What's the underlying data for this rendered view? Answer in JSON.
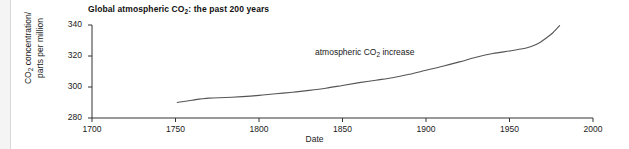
{
  "figure": {
    "background_color": "#ffffff",
    "axis_color": "#333333",
    "line_color": "#555555",
    "gutter_rule_color": "#d8d8d8"
  },
  "chart_data": {
    "type": "line",
    "title": "Global atmospheric CO2: the past 200 years",
    "title_parts": {
      "before": "Global atmospheric CO",
      "sub": "2",
      "after": ": the past 200 years"
    },
    "xlabel": "Date",
    "ylabel": "CO2 concentration/ parts per million",
    "ylabel_parts": {
      "line1_before": "CO",
      "line1_sub": "2",
      "line1_after": " concentration/",
      "line2": "parts per million"
    },
    "xlim": [
      1700,
      2000
    ],
    "ylim": [
      280,
      340
    ],
    "xticks": [
      1700,
      1750,
      1800,
      1850,
      1900,
      1950,
      2000
    ],
    "yticks": [
      280,
      300,
      320,
      340
    ],
    "grid": false,
    "legend": null,
    "annotations": [
      {
        "text": "atmospheric CO2 increase",
        "text_before": "atmospheric CO",
        "text_sub": "2",
        "text_after": " increase",
        "x": 1842,
        "y": 322
      }
    ],
    "series": [
      {
        "name": "atmospheric CO2 increase",
        "x": [
          1751,
          1760,
          1770,
          1780,
          1790,
          1800,
          1810,
          1820,
          1830,
          1840,
          1850,
          1860,
          1870,
          1880,
          1890,
          1900,
          1910,
          1920,
          1930,
          1940,
          1950,
          1955,
          1960,
          1963,
          1968,
          1972,
          1976,
          1980
        ],
        "values": [
          290.0,
          291.5,
          292.8,
          293.2,
          293.8,
          294.6,
          295.6,
          296.6,
          297.8,
          299.2,
          301.0,
          302.8,
          304.4,
          306.0,
          308.2,
          310.8,
          313.4,
          316.2,
          319.2,
          321.6,
          323.2,
          324.2,
          325.2,
          326.2,
          328.6,
          331.6,
          335.0,
          339.6
        ]
      }
    ]
  }
}
